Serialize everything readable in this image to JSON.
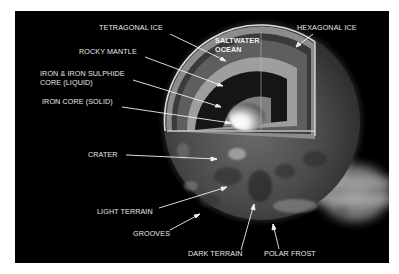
{
  "diagram": {
    "background_color": "#000000",
    "labels": [
      {
        "id": "tetragonal-ice",
        "text": "TETRAGONAL ICE"
      },
      {
        "id": "rocky-mantle",
        "text": "ROCKY MANTLE"
      },
      {
        "id": "iron-sulphide-core",
        "line1": "IRON & IRON SULPHIDE",
        "line2": "CORE (LIQUID)"
      },
      {
        "id": "iron-core",
        "text": "IRON CORE (SOLID)"
      },
      {
        "id": "saltwater-ocean",
        "line1": "SALTWATER",
        "line2": "OCEAN"
      },
      {
        "id": "hexagonal-ice",
        "text": "HEXAGONAL ICE"
      },
      {
        "id": "crater",
        "text": "CRATER"
      },
      {
        "id": "light-terrain",
        "text": "LIGHT TERRAIN"
      },
      {
        "id": "grooves",
        "text": "GROOVES"
      },
      {
        "id": "dark-terrain",
        "text": "DARK TERRAIN"
      },
      {
        "id": "polar-frost",
        "text": "POLAR FROST"
      }
    ],
    "layers_outer_to_inner": [
      "Hexagonal ice",
      "Saltwater ocean",
      "Tetragonal ice",
      "Rocky mantle",
      "Iron & iron sulphide core (liquid)",
      "Iron core (solid)"
    ],
    "background_object": "Jupiter"
  }
}
